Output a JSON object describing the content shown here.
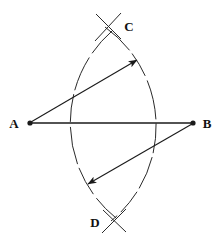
{
  "figure": {
    "background_color": "#ffffff",
    "stroke_color": "#1a1a1a",
    "width": 220,
    "height": 247
  },
  "points": [
    {
      "id": "A",
      "label": "A",
      "x": 30,
      "y": 123,
      "label_x": 14,
      "label_y": 128,
      "marker": "dot"
    },
    {
      "id": "B",
      "label": "B",
      "x": 193,
      "y": 123,
      "label_x": 204,
      "label_y": 128,
      "marker": "dot"
    },
    {
      "id": "C",
      "label": "C",
      "x": 108,
      "y": 27,
      "label_x": 126,
      "label_y": 31,
      "marker": "arc-crossing"
    },
    {
      "id": "D",
      "label": "D",
      "x": 113,
      "y": 220,
      "label_x": 91,
      "label_y": 226,
      "marker": "arc-crossing"
    }
  ],
  "segments": [
    {
      "id": "AB",
      "name": "segment-ab",
      "from": "A",
      "to": "B",
      "x1": 30,
      "y1": 123,
      "x2": 193,
      "y2": 123,
      "stroke_width": 1.6,
      "arrow": "none"
    }
  ],
  "arcs": [
    {
      "id": "arc-centered-at-A",
      "name": "arc-from-a",
      "center": "A",
      "center_x": 30,
      "center_y": 123,
      "radius": 122,
      "start_x": 105,
      "start_y": 27,
      "end_x": 111,
      "end_y": 221,
      "sweep": 1,
      "dashed": true,
      "stroke_width": 1.0
    },
    {
      "id": "arc-centered-at-B",
      "name": "arc-from-b",
      "center": "B",
      "center_x": 193,
      "center_y": 123,
      "radius": 122,
      "start_x": 112,
      "start_y": 31,
      "end_x": 116,
      "end_y": 218,
      "sweep": 0,
      "dashed": true,
      "stroke_width": 1.0
    }
  ],
  "radius_arrows": [
    {
      "id": "radius-arrow-upper",
      "name": "radius-arrow-a-to-c",
      "from": "A",
      "x1": 31,
      "y1": 122,
      "x2": 137,
      "y2": 60,
      "arrowhead": "end",
      "stroke_width": 1.1
    },
    {
      "id": "radius-arrow-lower",
      "name": "radius-arrow-b-to-d",
      "from": "B",
      "x1": 192,
      "y1": 124,
      "x2": 88,
      "y2": 184,
      "arrowhead": "end",
      "stroke_width": 1.1
    }
  ],
  "crossing_ticks": [
    {
      "id": "tick-c-1",
      "name": "crossing-tick-c-left",
      "x1": 96,
      "y1": 14,
      "x2": 121,
      "y2": 39
    },
    {
      "id": "tick-c-2",
      "name": "crossing-tick-c-right",
      "x1": 121,
      "y1": 13,
      "x2": 95,
      "y2": 41
    },
    {
      "id": "tick-d-1",
      "name": "crossing-tick-d-left",
      "x1": 103,
      "y1": 210,
      "x2": 126,
      "y2": 232
    },
    {
      "id": "tick-d-2",
      "name": "crossing-tick-d-right",
      "x1": 126,
      "y1": 209,
      "x2": 102,
      "y2": 233
    }
  ]
}
